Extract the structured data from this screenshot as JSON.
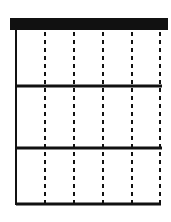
{
  "diagram": {
    "type": "grid-table",
    "header_bar": {
      "x1": 10,
      "x2": 168,
      "y1": 18,
      "y2": 30,
      "color": "#111111"
    },
    "left_border": {
      "x": 16,
      "y1": 30,
      "y2": 205
    },
    "row_dividers_y": [
      86,
      148
    ],
    "bottom_border_y": 204,
    "row_x_range": [
      16,
      162
    ],
    "dashed_columns_x": [
      45,
      74,
      103,
      132,
      160
    ],
    "rows": 3,
    "columns": 5,
    "line_color": "#111111",
    "background": "#ffffff"
  }
}
